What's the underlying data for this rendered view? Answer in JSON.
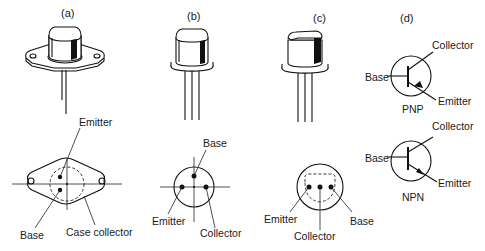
{
  "figure": {
    "panels": [
      {
        "id": "a",
        "label": "(a)",
        "package": "diamond-flange TO-3 style case",
        "pin_labels": {
          "emitter": "Emitter",
          "base": "Base",
          "case": "Case collector"
        }
      },
      {
        "id": "b",
        "label": "(b)",
        "package": "round can with three leads in triangle",
        "pin_labels": {
          "base": "Base",
          "emitter": "Emitter",
          "collector": "Collector"
        }
      },
      {
        "id": "c",
        "label": "(c)",
        "package": "flattened can with three in-line leads",
        "pin_labels": {
          "emitter": "Emitter",
          "collector": "Collector",
          "base": "Base"
        }
      },
      {
        "id": "d",
        "label": "(d)",
        "symbols": [
          {
            "type": "PNP",
            "caption": "PNP",
            "collector": "Collector",
            "base": "Base",
            "emitter": "Emitter"
          },
          {
            "type": "NPN",
            "caption": "NPN",
            "collector": "Collector",
            "base": "Base",
            "emitter": "Emitter"
          }
        ]
      }
    ]
  },
  "colors": {
    "ink": "#111111",
    "background": "#ffffff"
  }
}
